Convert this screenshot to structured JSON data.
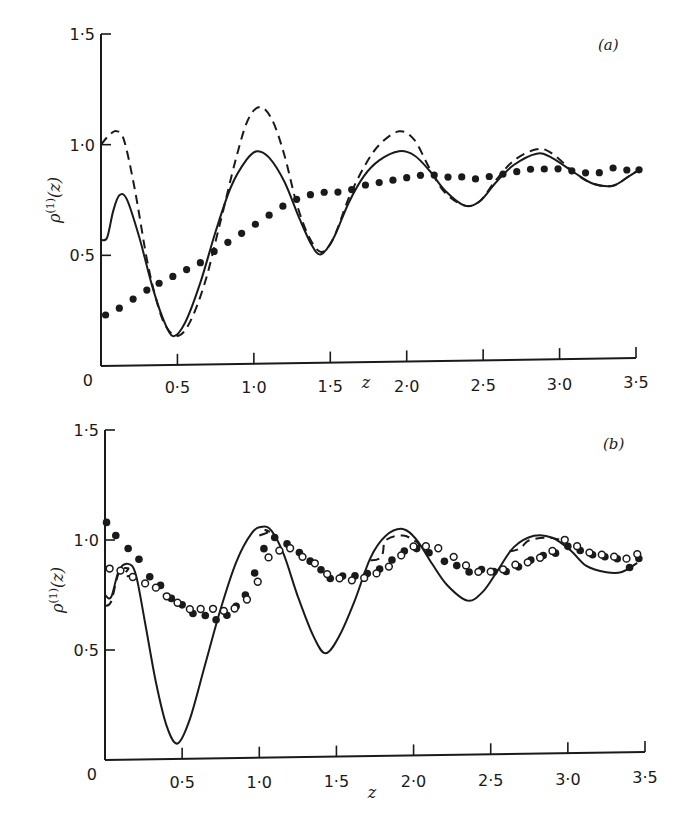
{
  "chart_data": [
    {
      "type": "line",
      "panel": "(a)",
      "xlabel": "z",
      "ylabel": "ρ(1)(z)",
      "xlim": [
        0,
        3.5
      ],
      "ylim": [
        0,
        1.5
      ],
      "xticks": [
        "0",
        "0·5",
        "1·0",
        "1·5",
        "2·0",
        "2·5",
        "3·0",
        "3·5"
      ],
      "yticks": [
        "0",
        "0·5",
        "1·0",
        "1·5"
      ],
      "grid": false,
      "legend": null,
      "series": [
        {
          "name": "solid",
          "style": "solid",
          "x": [
            0.0,
            0.04,
            0.08,
            0.12,
            0.17,
            0.25,
            0.33,
            0.4,
            0.47,
            0.55,
            0.65,
            0.75,
            0.85,
            0.95,
            1.02,
            1.1,
            1.2,
            1.3,
            1.38,
            1.44,
            1.52,
            1.62,
            1.72,
            1.82,
            1.95,
            2.05,
            2.15,
            2.25,
            2.38,
            2.48,
            2.58,
            2.7,
            2.85,
            2.95,
            3.1,
            3.22,
            3.35,
            3.45,
            3.52
          ],
          "y": [
            0.57,
            0.58,
            0.7,
            0.77,
            0.75,
            0.58,
            0.37,
            0.22,
            0.13,
            0.19,
            0.37,
            0.6,
            0.8,
            0.92,
            0.96,
            0.93,
            0.82,
            0.65,
            0.53,
            0.49,
            0.56,
            0.72,
            0.84,
            0.91,
            0.95,
            0.93,
            0.86,
            0.77,
            0.7,
            0.72,
            0.8,
            0.88,
            0.93,
            0.91,
            0.84,
            0.79,
            0.78,
            0.82,
            0.85
          ]
        },
        {
          "name": "dashed",
          "style": "dashed",
          "x": [
            0.0,
            0.05,
            0.1,
            0.15,
            0.22,
            0.3,
            0.36,
            0.42,
            0.5,
            0.58,
            0.68,
            0.78,
            0.88,
            0.96,
            1.04,
            1.12,
            1.2,
            1.28,
            1.36,
            1.44,
            1.52,
            1.62,
            1.72,
            1.82,
            1.95,
            2.05,
            2.15,
            2.25,
            2.38,
            2.48,
            2.58,
            2.7,
            2.85,
            2.95,
            3.1,
            3.22,
            3.35,
            3.45,
            3.52
          ],
          "y": [
            1.0,
            1.04,
            1.06,
            1.02,
            0.8,
            0.48,
            0.3,
            0.18,
            0.13,
            0.19,
            0.37,
            0.64,
            0.92,
            1.1,
            1.16,
            1.1,
            0.94,
            0.72,
            0.57,
            0.5,
            0.56,
            0.74,
            0.88,
            0.98,
            1.04,
            1.0,
            0.87,
            0.76,
            0.7,
            0.72,
            0.81,
            0.9,
            0.95,
            0.93,
            0.84,
            0.79,
            0.78,
            0.82,
            0.85
          ]
        },
        {
          "name": "dotted (filled circles)",
          "style": "dots",
          "x": [
            0.03,
            0.12,
            0.21,
            0.3,
            0.38,
            0.47,
            0.56,
            0.65,
            0.74,
            0.83,
            0.92,
            1.01,
            1.1,
            1.19,
            1.28,
            1.37,
            1.46,
            1.55,
            1.64,
            1.73,
            1.82,
            1.91,
            2.0,
            2.09,
            2.18,
            2.27,
            2.36,
            2.45,
            2.54,
            2.63,
            2.72,
            2.81,
            2.9,
            2.99,
            3.08,
            3.17,
            3.26,
            3.35,
            3.44,
            3.52
          ],
          "y": [
            0.23,
            0.26,
            0.3,
            0.34,
            0.37,
            0.4,
            0.43,
            0.46,
            0.51,
            0.55,
            0.59,
            0.63,
            0.67,
            0.71,
            0.74,
            0.76,
            0.77,
            0.77,
            0.78,
            0.8,
            0.81,
            0.82,
            0.83,
            0.84,
            0.84,
            0.83,
            0.83,
            0.82,
            0.83,
            0.84,
            0.85,
            0.86,
            0.86,
            0.86,
            0.85,
            0.84,
            0.84,
            0.86,
            0.85,
            0.85
          ]
        }
      ]
    },
    {
      "type": "line",
      "panel": "(b)",
      "xlabel": "z",
      "ylabel": "ρ(1)(z)",
      "xlim": [
        0,
        3.5
      ],
      "ylim": [
        0,
        1.5
      ],
      "xticks": [
        "0",
        "0·5",
        "1·0",
        "1·5",
        "2·0",
        "2·5",
        "3·0",
        "3·5"
      ],
      "yticks": [
        "0",
        "0·5",
        "1·0",
        "1·5"
      ],
      "grid": false,
      "legend": null,
      "series": [
        {
          "name": "solid",
          "style": "solid",
          "x": [
            0.0,
            0.04,
            0.09,
            0.15,
            0.2,
            0.26,
            0.33,
            0.4,
            0.47,
            0.55,
            0.65,
            0.75,
            0.85,
            0.95,
            1.02,
            1.08,
            1.16,
            1.25,
            1.35,
            1.43,
            1.52,
            1.62,
            1.72,
            1.82,
            1.93,
            2.02,
            2.12,
            2.22,
            2.35,
            2.45,
            2.55,
            2.65,
            2.78,
            2.9,
            3.02,
            3.12,
            3.25,
            3.35,
            3.45
          ],
          "y": [
            0.75,
            0.74,
            0.86,
            0.89,
            0.84,
            0.62,
            0.35,
            0.15,
            0.07,
            0.18,
            0.43,
            0.68,
            0.89,
            1.02,
            1.05,
            1.03,
            0.92,
            0.73,
            0.55,
            0.47,
            0.55,
            0.71,
            0.9,
            1.0,
            1.03,
            0.98,
            0.87,
            0.77,
            0.7,
            0.74,
            0.84,
            0.94,
            0.99,
            0.98,
            0.92,
            0.85,
            0.82,
            0.82,
            0.86
          ]
        },
        {
          "name": "dashed",
          "style": "dashed",
          "x": [
            0.0,
            0.04,
            0.09,
            0.15,
            0.2,
            1.0,
            1.05,
            1.1,
            1.72,
            1.82,
            1.93,
            2.02,
            2.12,
            2.62,
            2.75,
            2.88,
            3.0
          ],
          "y": [
            0.7,
            0.72,
            0.85,
            0.87,
            0.84,
            1.01,
            1.03,
            1.02,
            0.89,
            0.98,
            1.0,
            0.97,
            0.92,
            0.92,
            0.97,
            0.98,
            0.96
          ]
        },
        {
          "name": "filled circles",
          "style": "filled-markers",
          "x": [
            0.01,
            0.07,
            0.15,
            0.22,
            0.29,
            0.36,
            0.43,
            0.5,
            0.57,
            0.65,
            0.72,
            0.79,
            0.85,
            0.91,
            0.97,
            1.03,
            1.1,
            1.18,
            1.26,
            1.33,
            1.4,
            1.46,
            1.54,
            1.62,
            1.7,
            1.78,
            1.86,
            1.94,
            2.02,
            2.1,
            2.2,
            2.28,
            2.36,
            2.44,
            2.52,
            2.6,
            2.68,
            2.76,
            2.84,
            2.92,
            3.0,
            3.08,
            3.16,
            3.24,
            3.32,
            3.4,
            3.46
          ],
          "y": [
            1.08,
            1.02,
            0.96,
            0.91,
            0.83,
            0.79,
            0.73,
            0.7,
            0.66,
            0.65,
            0.63,
            0.65,
            0.69,
            0.74,
            0.84,
            0.95,
            1.0,
            0.97,
            0.93,
            0.89,
            0.85,
            0.81,
            0.82,
            0.82,
            0.83,
            0.85,
            0.89,
            0.93,
            0.94,
            0.92,
            0.88,
            0.86,
            0.83,
            0.84,
            0.83,
            0.83,
            0.85,
            0.88,
            0.9,
            0.91,
            0.94,
            0.92,
            0.9,
            0.89,
            0.88,
            0.84,
            0.88
          ]
        },
        {
          "name": "open circles",
          "style": "open-markers",
          "x": [
            0.03,
            0.1,
            0.18,
            0.26,
            0.33,
            0.4,
            0.47,
            0.55,
            0.62,
            0.7,
            0.77,
            0.84,
            0.92,
            0.99,
            1.06,
            1.13,
            1.2,
            1.28,
            1.36,
            1.44,
            1.52,
            1.6,
            1.68,
            1.76,
            1.84,
            1.92,
            2.0,
            2.08,
            2.16,
            2.26,
            2.34,
            2.42,
            2.5,
            2.58,
            2.66,
            2.74,
            2.82,
            2.9,
            2.98,
            3.06,
            3.14,
            3.22,
            3.3,
            3.38,
            3.45
          ],
          "y": [
            0.87,
            0.86,
            0.83,
            0.8,
            0.78,
            0.74,
            0.71,
            0.68,
            0.68,
            0.68,
            0.67,
            0.68,
            0.72,
            0.8,
            0.91,
            0.94,
            0.95,
            0.91,
            0.88,
            0.83,
            0.81,
            0.8,
            0.81,
            0.83,
            0.86,
            0.91,
            0.95,
            0.95,
            0.94,
            0.9,
            0.86,
            0.83,
            0.83,
            0.84,
            0.86,
            0.87,
            0.89,
            0.92,
            0.97,
            0.94,
            0.91,
            0.9,
            0.89,
            0.88,
            0.9
          ]
        }
      ]
    }
  ],
  "panels": [
    {
      "label": "(a)",
      "ylabel_main": "ρ",
      "ylabel_sup": "(1)",
      "ylabel_arg": "(z)",
      "xlabel": "z"
    },
    {
      "label": "(b)",
      "ylabel_main": "ρ",
      "ylabel_sup": "(1)",
      "ylabel_arg": "(z)",
      "xlabel": "z"
    }
  ],
  "ticks": {
    "x": [
      "0·5",
      "1·0",
      "1·5",
      "2·0",
      "2·5",
      "3·0",
      "3·5"
    ],
    "x_origin": "0",
    "y": [
      "0·5",
      "1·0",
      "1·5"
    ]
  },
  "colors": {
    "ink": "#1a1a1a",
    "background": "#ffffff"
  }
}
